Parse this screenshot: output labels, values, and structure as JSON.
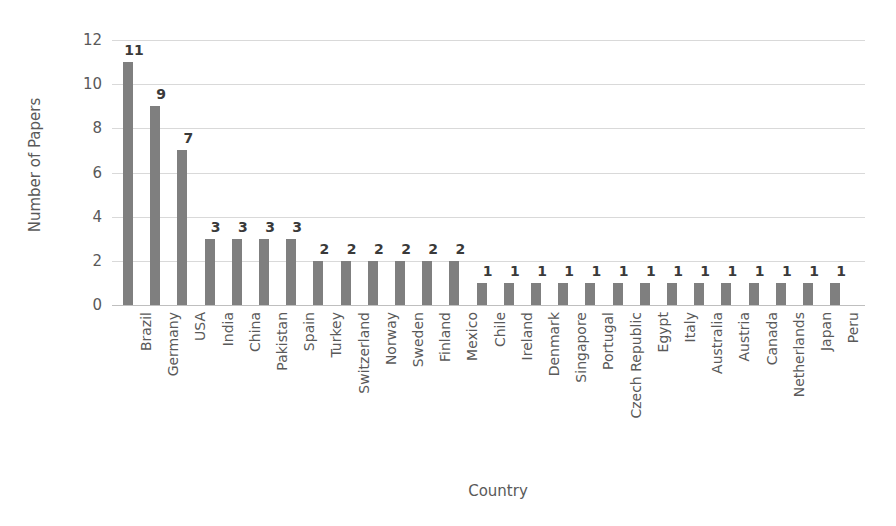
{
  "chart_data": {
    "type": "bar",
    "title": "",
    "xlabel": "Country",
    "ylabel": "Number of Papers",
    "ylim": [
      0,
      12
    ],
    "ytick_step": 2,
    "yticks": [
      0,
      2,
      4,
      6,
      8,
      10,
      12
    ],
    "grid": true,
    "legend": false,
    "bar_color": "#7f7f7f",
    "gridline_color": "#d9d9d9",
    "data_labels_shown": true,
    "categories": [
      "Brazil",
      "Germany",
      "USA",
      "India",
      "China",
      "Pakistan",
      "Spain",
      "Turkey",
      "Switzerland",
      "Norway",
      "Sweden",
      "Finland",
      "Mexico",
      "Chile",
      "Ireland",
      "Denmark",
      "Singapore",
      "Portugal",
      "Czech Republic",
      "Egypt",
      "Italy",
      "Australia",
      "Austria",
      "Canada",
      "Netherlands",
      "Japan",
      "Peru"
    ],
    "values": [
      11,
      9,
      7,
      3,
      3,
      3,
      3,
      2,
      2,
      2,
      2,
      2,
      2,
      1,
      1,
      1,
      1,
      1,
      1,
      1,
      1,
      1,
      1,
      1,
      1,
      1,
      1
    ]
  }
}
